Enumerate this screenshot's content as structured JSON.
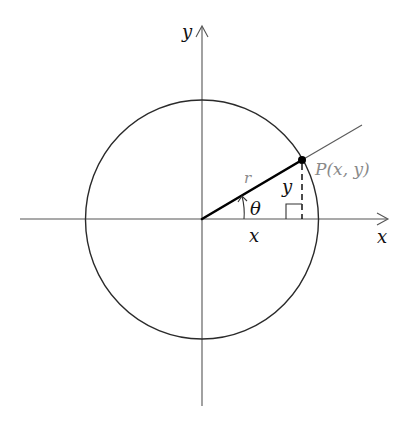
{
  "diagram": {
    "labels": {
      "y_axis": "y",
      "x_axis": "x",
      "radius": "r",
      "angle": "θ",
      "x_component": "x",
      "y_component": "y",
      "point": "P(x, y)"
    },
    "colors": {
      "background": "#ffffff",
      "axis": "#555555",
      "circle": "#2a2a2a",
      "radius": "#000000",
      "ray": "#5a5a5a",
      "point_label": "#8a8a8a",
      "radius_label": "#8a8a8a",
      "text": "#111111"
    },
    "geometry": {
      "origin": [
        202,
        219
      ],
      "circle_radius": 118,
      "point": [
        302,
        160
      ],
      "ray_end": [
        362,
        125
      ],
      "x_axis_range": [
        20,
        388
      ],
      "y_axis_range": [
        6,
        406
      ]
    }
  }
}
